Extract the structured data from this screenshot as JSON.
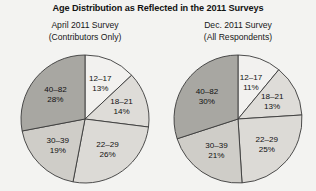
{
  "chart_data": [
    {
      "type": "pie",
      "title": "Age Distribution as Reflected in the 2011 Surveys",
      "subtitle": "April 2011 Survey (Contributors Only)",
      "subtitle_line1": "April 2011 Survey",
      "subtitle_line2": "(Contributors Only)",
      "categories": [
        "12–17",
        "18–21",
        "22–29",
        "30–39",
        "40–82"
      ],
      "values": [
        13,
        14,
        26,
        19,
        28
      ],
      "value_suffix": "%",
      "start_angle_deg": 0,
      "direction": "clockwise",
      "legend": "none",
      "labels_inside": true,
      "slice_colors": [
        "#f2f1ef",
        "#dedcd8",
        "#dcdad6",
        "#cfcdc8",
        "#a8a7a2"
      ],
      "slice_outline": "#3a3a3a"
    },
    {
      "type": "pie",
      "title": "Age Distribution as Reflected in the 2011 Surveys",
      "subtitle": "Dec. 2011 Survey (All Respondents)",
      "subtitle_line1": "Dec. 2011 Survey",
      "subtitle_line2": "(All Respondents)",
      "categories": [
        "12–17",
        "18–21",
        "22–29",
        "30–39",
        "40–82"
      ],
      "values": [
        11,
        13,
        25,
        21,
        30
      ],
      "value_suffix": "%",
      "start_angle_deg": 0,
      "direction": "clockwise",
      "legend": "none",
      "labels_inside": true,
      "slice_colors": [
        "#f2f1ef",
        "#dedcd8",
        "#dcdad6",
        "#cfcdc8",
        "#a8a7a2"
      ],
      "slice_outline": "#3a3a3a"
    }
  ],
  "figure": {
    "title": "Age Distribution as Reflected in the 2011 Surveys",
    "background": "#f3f3f1"
  },
  "panels": [
    {
      "id": "april",
      "subtitle_line1": "April 2011 Survey",
      "subtitle_line2": "(Contributors Only)",
      "slices": [
        {
          "label": "12–17",
          "percent": "13%"
        },
        {
          "label": "18–21",
          "percent": "14%"
        },
        {
          "label": "22–29",
          "percent": "26%"
        },
        {
          "label": "30–39",
          "percent": "19%"
        },
        {
          "label": "40–82",
          "percent": "28%"
        }
      ]
    },
    {
      "id": "dec",
      "subtitle_line1": "Dec. 2011 Survey",
      "subtitle_line2": "(All Respondents)",
      "slices": [
        {
          "label": "12–17",
          "percent": "11%"
        },
        {
          "label": "18–21",
          "percent": "13%"
        },
        {
          "label": "22–29",
          "percent": "25%"
        },
        {
          "label": "30–39",
          "percent": "21%"
        },
        {
          "label": "40–82",
          "percent": "30%"
        }
      ]
    }
  ]
}
